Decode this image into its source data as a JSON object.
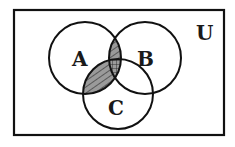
{
  "diagram": {
    "type": "venn",
    "universe_label": "U",
    "sets": [
      {
        "label": "A",
        "cx": 85,
        "cy": 58,
        "r": 36
      },
      {
        "label": "B",
        "cx": 145,
        "cy": 58,
        "r": 36
      },
      {
        "label": "C",
        "cx": 118,
        "cy": 94,
        "r": 35
      }
    ],
    "shaded_region": "(A ∩ B) ∪ (A ∩ C)",
    "shading": {
      "A_and_B": "hatched",
      "A_and_C": "hatched",
      "A_and_B_and_C": "cross-hatched"
    },
    "colors": {
      "stroke": "#111111",
      "fill": "#9a9a9a",
      "background": "#ffffff"
    }
  }
}
